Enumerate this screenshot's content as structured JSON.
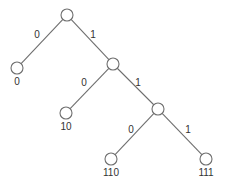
{
  "diagram": {
    "type": "binary-code-tree",
    "nodes": [
      {
        "id": "root",
        "x": 67,
        "y": 15,
        "label": ""
      },
      {
        "id": "n0",
        "x": 17,
        "y": 68,
        "label": "0"
      },
      {
        "id": "n1",
        "x": 113,
        "y": 64,
        "label": ""
      },
      {
        "id": "n10",
        "x": 66,
        "y": 113,
        "label": "10"
      },
      {
        "id": "n11",
        "x": 158,
        "y": 109,
        "label": ""
      },
      {
        "id": "n110",
        "x": 111,
        "y": 159,
        "label": "110"
      },
      {
        "id": "n111",
        "x": 206,
        "y": 159,
        "label": "111"
      }
    ],
    "edges": [
      {
        "from": "root",
        "to": "n0",
        "bit": "0",
        "lx": 37,
        "ly": 38
      },
      {
        "from": "root",
        "to": "n1",
        "bit": "1",
        "lx": 93,
        "ly": 38
      },
      {
        "from": "n1",
        "to": "n10",
        "bit": "0",
        "lx": 84,
        "ly": 86
      },
      {
        "from": "n1",
        "to": "n11",
        "bit": "1",
        "lx": 138,
        "ly": 86
      },
      {
        "from": "n11",
        "to": "n110",
        "bit": "0",
        "lx": 131,
        "ly": 133
      },
      {
        "from": "n11",
        "to": "n111",
        "bit": "1",
        "lx": 188,
        "ly": 133
      }
    ],
    "node_radius": 6,
    "colors": {
      "line": "#6e6e6e",
      "text": "#333333"
    }
  }
}
